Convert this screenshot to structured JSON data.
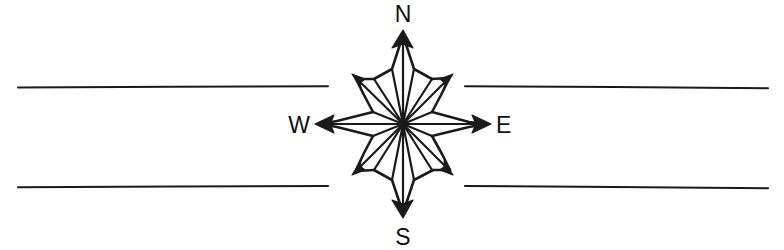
{
  "figure": {
    "canvas": {
      "width": 784,
      "height": 250
    },
    "background_color": "#ffffff",
    "ink_color": "#1a1a1a"
  },
  "compass": {
    "center": {
      "x": 403,
      "y": 124
    },
    "style": "hand-drawn",
    "point_count": 8,
    "labels": {
      "north": "N",
      "south": "S",
      "east": "E",
      "west": "W"
    },
    "label_positions": {
      "north": {
        "x": 403,
        "y": 22
      },
      "south": {
        "x": 403,
        "y": 237
      },
      "east": {
        "x": 500,
        "y": 132
      },
      "west": {
        "x": 297,
        "y": 132
      }
    },
    "points": [
      {
        "name": "N",
        "angle_deg": 0,
        "radius": 92,
        "tip": {
          "x": 403,
          "y": 32
        },
        "arrowhead": true,
        "major": true
      },
      {
        "name": "NE",
        "angle_deg": 45,
        "radius": 68,
        "tip": {
          "x": 451,
          "y": 76
        },
        "arrowhead": true,
        "major": false
      },
      {
        "name": "E",
        "angle_deg": 90,
        "radius": 86,
        "tip": {
          "x": 489,
          "y": 124
        },
        "arrowhead": true,
        "major": true
      },
      {
        "name": "SE",
        "angle_deg": 135,
        "radius": 68,
        "tip": {
          "x": 451,
          "y": 172
        },
        "arrowhead": true,
        "major": false
      },
      {
        "name": "S",
        "angle_deg": 180,
        "radius": 92,
        "tip": {
          "x": 403,
          "y": 216
        },
        "arrowhead": true,
        "major": true
      },
      {
        "name": "SW",
        "angle_deg": 225,
        "radius": 68,
        "tip": {
          "x": 355,
          "y": 172
        },
        "arrowhead": true,
        "major": false
      },
      {
        "name": "W",
        "angle_deg": 270,
        "radius": 86,
        "tip": {
          "x": 317,
          "y": 124
        },
        "arrowhead": true,
        "major": true
      },
      {
        "name": "NW",
        "angle_deg": 315,
        "radius": 68,
        "tip": {
          "x": 355,
          "y": 76
        },
        "arrowhead": true,
        "major": false
      }
    ]
  },
  "rule_lines": [
    {
      "name": "top-left-rule",
      "x1": 18,
      "y1": 87,
      "x2": 328,
      "y2": 86
    },
    {
      "name": "top-right-rule",
      "x1": 465,
      "y1": 86,
      "x2": 768,
      "y2": 88
    },
    {
      "name": "bottom-left-rule",
      "x1": 18,
      "y1": 187,
      "x2": 328,
      "y2": 186
    },
    {
      "name": "bottom-right-rule",
      "x1": 465,
      "y1": 186,
      "x2": 768,
      "y2": 188
    }
  ]
}
